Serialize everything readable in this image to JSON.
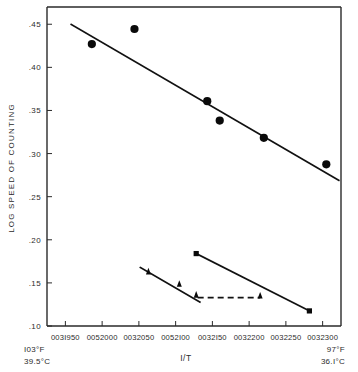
{
  "chart_data": {
    "type": "scatter",
    "title": "",
    "xlabel": "I/T",
    "ylabel": "LOG SPEED OF COUNTING",
    "grid": false,
    "legend": "none",
    "xlim": [
      0.0031925,
      0.0032325
    ],
    "ylim": [
      0.1,
      0.47
    ],
    "x_tick_labels": [
      "003I950",
      "0052000",
      "0032050",
      "0052I00",
      "0032I50",
      "0032200",
      "0032250",
      "0032300"
    ],
    "x_tick_values": [
      0.003195,
      0.0032,
      0.003205,
      0.00321,
      0.003215,
      0.00322,
      0.003225,
      0.00323
    ],
    "y_tick_labels": [
      ".45",
      ".40",
      ".35",
      ".30",
      ".25",
      ".20",
      ".15",
      ".10"
    ],
    "y_tick_values": [
      0.45,
      0.4,
      0.35,
      0.3,
      0.25,
      0.2,
      0.15,
      0.1
    ],
    "left_temp_f": "I03°F",
    "left_temp_c": "39.5°C",
    "right_temp_f": "97°F",
    "right_temp_c": "36.I°C",
    "series": [
      {
        "name": "upper-circles",
        "marker": "circle",
        "points": [
          {
            "x": 0.0031986,
            "y": 0.427
          },
          {
            "x": 0.0032044,
            "y": 0.4445
          },
          {
            "x": 0.0032143,
            "y": 0.3608
          },
          {
            "x": 0.003216,
            "y": 0.3383
          },
          {
            "x": 0.003222,
            "y": 0.3183
          },
          {
            "x": 0.0032305,
            "y": 0.2875
          }
        ]
      },
      {
        "name": "lower-triangles",
        "marker": "triangle",
        "points": [
          {
            "x": 0.0032063,
            "y": 0.1612
          },
          {
            "x": 0.0032105,
            "y": 0.1468
          },
          {
            "x": 0.0032128,
            "y": 0.1342
          },
          {
            "x": 0.0032215,
            "y": 0.1333
          }
        ]
      },
      {
        "name": "lower-squares",
        "marker": "square",
        "points": [
          {
            "x": 0.0032128,
            "y": 0.184
          },
          {
            "x": 0.0032282,
            "y": 0.1175
          }
        ]
      }
    ],
    "fit_lines": [
      {
        "name": "upper-trend",
        "style": "solid",
        "x1": 0.0031958,
        "y1": 0.4498,
        "x2": 0.0032322,
        "y2": 0.269
      },
      {
        "name": "triangle-trend",
        "style": "solid",
        "x1": 0.0032052,
        "y1": 0.1678,
        "x2": 0.0032133,
        "y2": 0.1278
      },
      {
        "name": "square-trend",
        "style": "solid",
        "x1": 0.0032128,
        "y1": 0.184,
        "x2": 0.0032282,
        "y2": 0.1175
      }
    ],
    "reference_lines": [
      {
        "name": "horizontal-dashed",
        "style": "dashed",
        "x1": 0.003213,
        "y1": 0.133,
        "x2": 0.0032215,
        "y2": 0.133
      }
    ]
  }
}
